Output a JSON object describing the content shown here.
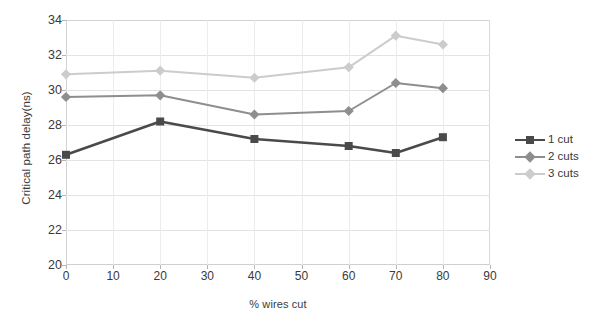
{
  "chart_data": {
    "type": "line",
    "title": "",
    "xlabel": "% wires cut",
    "ylabel": "Critical path delay(ns)",
    "xlim": [
      0,
      90
    ],
    "ylim": [
      20,
      34
    ],
    "xticks": [
      0,
      10,
      20,
      30,
      40,
      50,
      60,
      70,
      80,
      90
    ],
    "yticks": [
      20,
      22,
      24,
      26,
      28,
      30,
      32,
      34
    ],
    "grid": true,
    "legend_position": "right",
    "x": [
      0,
      20,
      40,
      60,
      70,
      80
    ],
    "series": [
      {
        "name": "1 cut",
        "values": [
          26.3,
          28.2,
          27.2,
          26.8,
          26.4,
          27.3
        ],
        "color": "#4a4a4a",
        "marker": "square"
      },
      {
        "name": "2 cuts",
        "values": [
          29.6,
          29.7,
          28.6,
          28.8,
          30.4,
          30.1
        ],
        "color": "#8e8e8e",
        "marker": "diamond"
      },
      {
        "name": "3 cuts",
        "values": [
          30.9,
          31.1,
          30.7,
          31.3,
          33.1,
          32.6
        ],
        "color": "#cccccc",
        "marker": "diamond"
      }
    ]
  },
  "axes": {
    "y_title": "Critical path delay(ns)",
    "x_title": "% wires cut",
    "y_tick_labels": [
      "34",
      "32",
      "30",
      "28",
      "26",
      "24",
      "22",
      "20"
    ],
    "x_tick_labels": [
      "0",
      "10",
      "20",
      "30",
      "40",
      "50",
      "60",
      "70",
      "80",
      "90"
    ]
  },
  "legend": {
    "items": [
      {
        "label": "1 cut",
        "color": "#4a4a4a"
      },
      {
        "label": "2 cuts",
        "color": "#8e8e8e"
      },
      {
        "label": "3 cuts",
        "color": "#cccccc"
      }
    ]
  }
}
